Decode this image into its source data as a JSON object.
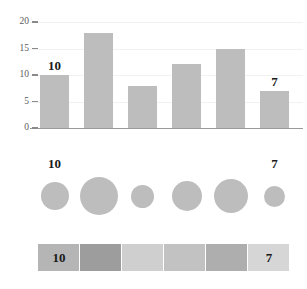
{
  "chart_data": {
    "type": "bar",
    "title": "",
    "subtitle": "",
    "xlabel": "",
    "ylabel": "",
    "categories": [
      "1",
      "2",
      "3",
      "4",
      "5",
      "6"
    ],
    "values": [
      10,
      18,
      8,
      12,
      15,
      7
    ],
    "ylim": [
      0,
      20
    ],
    "y_ticks": [
      0,
      5,
      10,
      15,
      20
    ],
    "y_tick_labels": [
      "0",
      "5",
      "10",
      "15",
      "20"
    ],
    "grid": true,
    "legend": "none",
    "annotations": [
      {
        "index": 0,
        "text": "10"
      },
      {
        "index": 5,
        "text": "7"
      }
    ],
    "panels": [
      {
        "encoding": "bar-height",
        "values": [
          10,
          18,
          8,
          12,
          15,
          7
        ],
        "bar_color": "#bdbdbd",
        "labels": [
          "10",
          "",
          "",
          "",
          "",
          "7"
        ]
      },
      {
        "encoding": "circle-area",
        "values": [
          10,
          18,
          8,
          12,
          15,
          7
        ],
        "circle_color": "#bdbdbd",
        "diameters": [
          28,
          38,
          23,
          30,
          34,
          21
        ],
        "labels": [
          "10",
          "",
          "",
          "",
          "",
          "7"
        ]
      },
      {
        "encoding": "color-shade",
        "values": [
          10,
          18,
          8,
          12,
          15,
          7
        ],
        "cell_colors": [
          "#b5b5b5",
          "#9d9d9d",
          "#cfcfcf",
          "#c2c2c2",
          "#aeaeae",
          "#d6d6d6"
        ],
        "labels": [
          "10",
          "",
          "",
          "",
          "",
          "7"
        ]
      }
    ]
  },
  "axis": {
    "ticks": [
      {
        "value": 20,
        "label": "20"
      },
      {
        "value": 15,
        "label": "15"
      },
      {
        "value": 10,
        "label": "10"
      },
      {
        "value": 5,
        "label": "5"
      },
      {
        "value": 0,
        "label": "0"
      }
    ]
  },
  "bars": [
    {
      "value": 10,
      "label": "10"
    },
    {
      "value": 18,
      "label": ""
    },
    {
      "value": 8,
      "label": ""
    },
    {
      "value": 12,
      "label": ""
    },
    {
      "value": 15,
      "label": ""
    },
    {
      "value": 7,
      "label": "7"
    }
  ],
  "circles": [
    {
      "value": 10,
      "label": "10"
    },
    {
      "value": 18,
      "label": ""
    },
    {
      "value": 8,
      "label": ""
    },
    {
      "value": 12,
      "label": ""
    },
    {
      "value": 15,
      "label": ""
    },
    {
      "value": 7,
      "label": "7"
    }
  ],
  "cells": [
    {
      "value": 10,
      "label": "10"
    },
    {
      "value": 18,
      "label": ""
    },
    {
      "value": 8,
      "label": ""
    },
    {
      "value": 12,
      "label": ""
    },
    {
      "value": 15,
      "label": ""
    },
    {
      "value": 7,
      "label": "7"
    }
  ],
  "colors": {
    "mark": "#bdbdbd",
    "axis": "#9a9a9a",
    "grid": "#f1f1f1",
    "tick_text": "#5a5a5a",
    "label_text": "#1a1a1a",
    "background": "#ffffff"
  }
}
